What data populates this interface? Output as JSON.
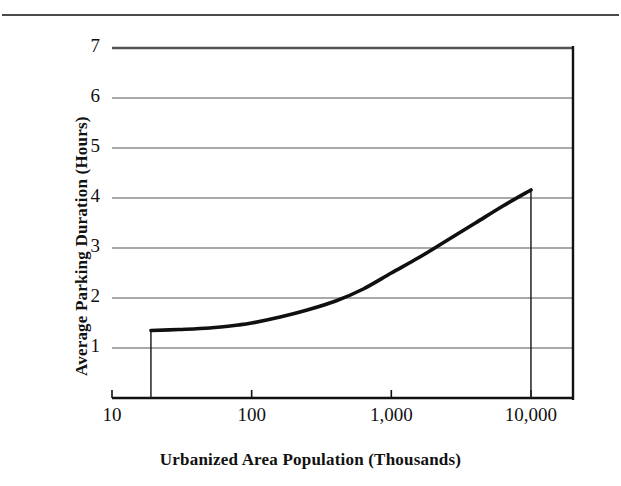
{
  "figure": {
    "has_top_rule": true,
    "background_color": "#ffffff",
    "ink_color": "#111111",
    "gridline_color": "#555555",
    "curve_color": "#101010"
  },
  "chart_data": {
    "type": "line",
    "title": "",
    "xlabel": "Urbanized Area Population (Thousands)",
    "ylabel": "Average Parking Duration (Hours)",
    "x_scale": "log",
    "y_scale": "linear",
    "xlim": [
      10,
      20000
    ],
    "ylim": [
      0,
      7
    ],
    "xticks": [
      10,
      100,
      1000,
      10000
    ],
    "xtick_labels": [
      "10",
      "100",
      "1,000",
      "10,000"
    ],
    "yticks": [
      1,
      2,
      3,
      4,
      5,
      6,
      7
    ],
    "ytick_labels": [
      "1",
      "2",
      "3",
      "4",
      "5",
      "6",
      "7"
    ],
    "grid": "horizontal",
    "legend": "none",
    "series": [
      {
        "name": "Average parking duration",
        "x": [
          19,
          30,
          50,
          80,
          100,
          160,
          250,
          400,
          630,
          1000,
          1600,
          2500,
          4000,
          6300,
          10000
        ],
        "y": [
          1.35,
          1.37,
          1.4,
          1.46,
          1.5,
          1.62,
          1.76,
          1.94,
          2.18,
          2.5,
          2.82,
          3.15,
          3.5,
          3.84,
          4.16
        ]
      }
    ],
    "annotations": [
      {
        "kind": "vertical-drop-line",
        "x": 19,
        "y_top": 1.35,
        "y_bottom": 0
      },
      {
        "kind": "vertical-drop-line",
        "x": 10000,
        "y_top": 4.16,
        "y_bottom": 0
      }
    ]
  }
}
